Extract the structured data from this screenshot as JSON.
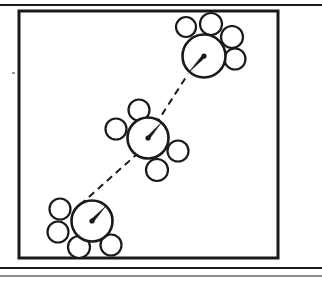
{
  "figure": {
    "description": "Three clusters, each a large circle with a centre point and radius arrow, surrounded by four small circles, connected in a chain by dashed lines.",
    "background_color": "#ffffff",
    "stroke_color": "#1a1a1a",
    "frame": {
      "name": "figure-frame",
      "x": 19,
      "y": 11,
      "width": 259,
      "height": 247,
      "stroke_width": 3
    },
    "rules": [
      {
        "name": "top-rule",
        "x1": 0,
        "y1": 5,
        "x2": 322,
        "y2": 5,
        "stroke_width": 2
      },
      {
        "name": "bottom-rule-upper",
        "x1": 0,
        "y1": 268,
        "x2": 322,
        "y2": 268,
        "stroke_width": 2
      },
      {
        "name": "bottom-rule-lower",
        "x1": 0,
        "y1": 276,
        "x2": 322,
        "y2": 276,
        "stroke_width": 1
      }
    ],
    "stray_mark": {
      "name": "stray-mark",
      "x": 12,
      "y": 72,
      "width": 3,
      "height": 2
    }
  },
  "chart_data": {
    "type": "scatter",
    "xlabel": "",
    "ylabel": "",
    "xlim": [
      0,
      322
    ],
    "ylim": [
      0,
      282
    ],
    "grid": false,
    "legend": "none",
    "units": "pixels",
    "clusters": [
      {
        "id": "cluster-top-right",
        "label": "Top-right cluster",
        "center": {
          "x": 204,
          "y": 56
        },
        "radius": 21.5,
        "centre_dot_radius": 2.6,
        "radius_arrow": {
          "x1": 204,
          "y1": 56,
          "x2": 189,
          "y2": 72
        },
        "satellites": [
          {
            "id": "sat-tr-1",
            "x": 186,
            "y": 27,
            "r": 10
          },
          {
            "id": "sat-tr-2",
            "x": 211,
            "y": 24,
            "r": 11
          },
          {
            "id": "sat-tr-3",
            "x": 232,
            "y": 37,
            "r": 11
          },
          {
            "id": "sat-tr-4",
            "x": 235,
            "y": 59,
            "r": 10.5
          }
        ]
      },
      {
        "id": "cluster-middle",
        "label": "Middle cluster",
        "center": {
          "x": 148,
          "y": 138
        },
        "radius": 20.5,
        "centre_dot_radius": 2.6,
        "radius_arrow": {
          "x1": 148,
          "y1": 138,
          "x2": 161,
          "y2": 123
        },
        "satellites": [
          {
            "id": "sat-m-1",
            "x": 139,
            "y": 110,
            "r": 10.5
          },
          {
            "id": "sat-m-2",
            "x": 116,
            "y": 129,
            "r": 10.5
          },
          {
            "id": "sat-m-3",
            "x": 178,
            "y": 151,
            "r": 10.5
          },
          {
            "id": "sat-m-4",
            "x": 157,
            "y": 170,
            "r": 11
          }
        ]
      },
      {
        "id": "cluster-bottom-left",
        "label": "Bottom-left cluster",
        "center": {
          "x": 92,
          "y": 221
        },
        "radius": 20.5,
        "centre_dot_radius": 2.6,
        "radius_arrow": {
          "x1": 92,
          "y1": 221,
          "x2": 105,
          "y2": 207
        },
        "satellites": [
          {
            "id": "sat-bl-1",
            "x": 60,
            "y": 209,
            "r": 10.5
          },
          {
            "id": "sat-bl-2",
            "x": 58,
            "y": 232,
            "r": 10.5
          },
          {
            "id": "sat-bl-3",
            "x": 79,
            "y": 247,
            "r": 11
          },
          {
            "id": "sat-bl-4",
            "x": 111,
            "y": 245,
            "r": 10.5
          }
        ]
      }
    ],
    "connectors": [
      {
        "id": "connector-middle-to-top-right",
        "from": "cluster-middle",
        "to": "cluster-top-right",
        "style": "dashed",
        "dash_pattern": "7 5",
        "x1": 136,
        "y1": 155,
        "x2": 188,
        "y2": 74
      },
      {
        "id": "connector-bottom-left-to-middle",
        "from": "cluster-bottom-left",
        "to": "cluster-middle",
        "style": "dashed",
        "dash_pattern": "7 5",
        "x1": 80,
        "y1": 205,
        "x2": 136,
        "y2": 155
      }
    ]
  }
}
